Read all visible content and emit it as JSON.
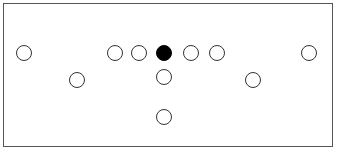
{
  "diagram": {
    "type": "formation",
    "border_color": "#555555",
    "players": [
      {
        "id": "p1",
        "x": 24,
        "y": 53,
        "filled": false
      },
      {
        "id": "p2",
        "x": 115,
        "y": 53,
        "filled": false
      },
      {
        "id": "p3",
        "x": 139,
        "y": 53,
        "filled": false
      },
      {
        "id": "p4",
        "x": 164,
        "y": 53,
        "filled": true
      },
      {
        "id": "p5",
        "x": 191,
        "y": 53,
        "filled": false
      },
      {
        "id": "p6",
        "x": 217,
        "y": 53,
        "filled": false
      },
      {
        "id": "p7",
        "x": 309,
        "y": 53,
        "filled": false
      },
      {
        "id": "p8",
        "x": 77,
        "y": 80,
        "filled": false
      },
      {
        "id": "p9",
        "x": 164,
        "y": 77,
        "filled": false
      },
      {
        "id": "p10",
        "x": 253,
        "y": 80,
        "filled": false
      },
      {
        "id": "p11",
        "x": 164,
        "y": 117,
        "filled": false
      }
    ]
  }
}
